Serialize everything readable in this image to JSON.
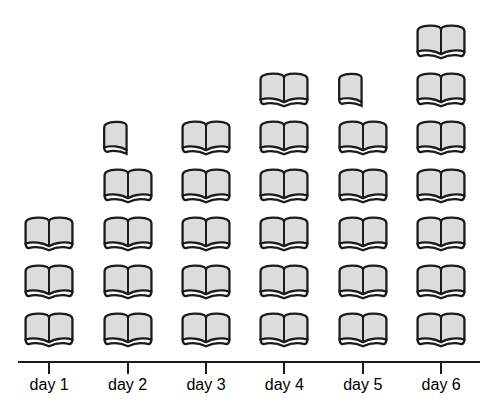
{
  "chart_data": {
    "type": "bar",
    "variant": "pictograph",
    "icon": "open-book",
    "unit_per_icon": 1,
    "title": "",
    "xlabel": "",
    "ylabel": "",
    "categories": [
      "day 1",
      "day 2",
      "day 3",
      "day 4",
      "day 5",
      "day 6"
    ],
    "values": [
      3,
      4.5,
      5,
      6,
      5.5,
      7
    ],
    "icon_counts": [
      {
        "full": 3,
        "half": 0
      },
      {
        "full": 4,
        "half": 1
      },
      {
        "full": 5,
        "half": 0
      },
      {
        "full": 6,
        "half": 0
      },
      {
        "full": 5,
        "half": 1
      },
      {
        "full": 7,
        "half": 0
      }
    ],
    "axis": {
      "x_line": true,
      "ticks": true,
      "grid": false,
      "legend": "none",
      "ylim": [
        0,
        7
      ]
    },
    "colors": {
      "background": "#ffffff",
      "book_fill": "#dcdcdc",
      "book_outline": "#1b1b1b",
      "axis_line": "#1b1b1b",
      "label_text": "#000000"
    }
  }
}
